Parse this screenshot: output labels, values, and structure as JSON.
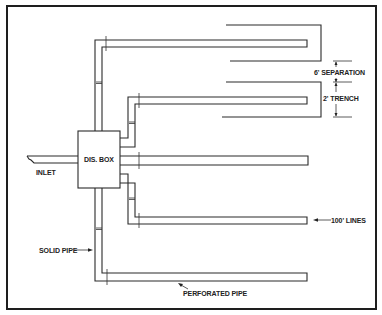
{
  "diagram": {
    "labels": {
      "dis_box": "DIS. BOX",
      "inlet": "INLET",
      "separation": "6' SEPARATION",
      "trench": "2' TRENCH",
      "lines": "100' LINES",
      "solid_pipe": "SOLID PIPE",
      "perforated_pipe": "PERFORATED PIPE"
    },
    "colors": {
      "line": "#2a2a2a",
      "background": "#ffffff"
    }
  }
}
